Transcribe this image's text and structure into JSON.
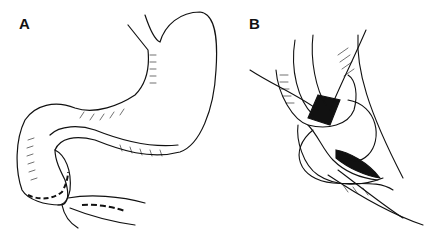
{
  "figure": {
    "panels": [
      {
        "label": "A",
        "description": "Stomach and duodenum with dashed incision lines on pylorus and duodenum"
      },
      {
        "label": "B",
        "description": "Opened pyloric region with sutures placed (pyloroplasty)"
      }
    ],
    "colors": {
      "ink": "#111111",
      "background": "#ffffff"
    }
  }
}
